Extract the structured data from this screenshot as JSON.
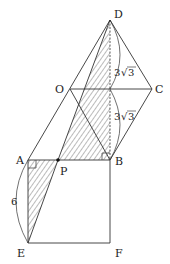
{
  "diagram": {
    "type": "geometry-figure",
    "points": {
      "D": {
        "label": "D",
        "x": 110,
        "y": 20
      },
      "O": {
        "label": "O",
        "x": 70,
        "y": 89
      },
      "C": {
        "label": "C",
        "x": 152,
        "y": 89
      },
      "A": {
        "label": "A",
        "x": 28,
        "y": 160
      },
      "P": {
        "label": "P",
        "x": 58,
        "y": 160
      },
      "B": {
        "label": "B",
        "x": 110,
        "y": 160
      },
      "E": {
        "label": "E",
        "x": 28,
        "y": 243
      },
      "F": {
        "label": "F",
        "x": 110,
        "y": 243
      }
    },
    "measurements": {
      "upper": {
        "coef": "3",
        "radicand": "3"
      },
      "lower": {
        "coef": "3",
        "radicand": "3"
      },
      "ae": "6"
    },
    "colors": {
      "stroke": "#333333",
      "hatch": "#444444"
    }
  }
}
